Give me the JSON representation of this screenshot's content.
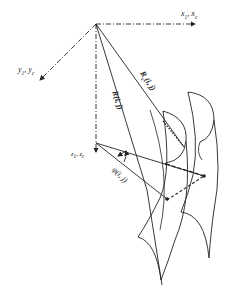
{
  "diagram": {
    "type": "coordinate-geometry",
    "colors": {
      "line": "#222222",
      "background": "#ffffff"
    },
    "labels": {
      "x_axis": {
        "main": "x",
        "sub1": "1",
        "sep": ", ",
        "main2": "x",
        "sub2": "c"
      },
      "y_axis": {
        "main": "y",
        "sub1": "1",
        "sep": ", ",
        "main2": "y",
        "sub2": "c"
      },
      "z_axis": {
        "main": "z",
        "sub1": "1",
        "sep": ", ",
        "main2": "z",
        "sub2": "c"
      },
      "vector_rc": {
        "text": "R",
        "sub": "c",
        "args": "(i, j)"
      },
      "vector_r": {
        "text": "R",
        "args": "(i, j)"
      },
      "angle_phi": {
        "text": "φ",
        "args": "(i, j)"
      }
    }
  }
}
